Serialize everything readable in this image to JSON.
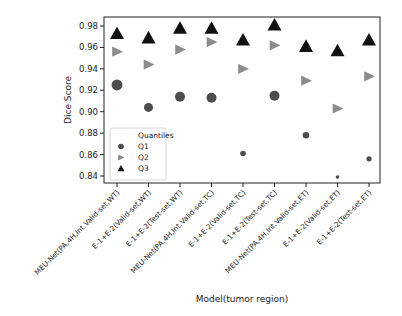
{
  "chart_data": {
    "type": "scatter",
    "title": "",
    "xlabel": "Model(tumor region)",
    "ylabel": "Dice Score",
    "ylim": [
      0.835,
      0.986
    ],
    "yticks": [
      0.84,
      0.86,
      0.88,
      0.9,
      0.92,
      0.94,
      0.96,
      0.98
    ],
    "ytick_labels": [
      "0.84",
      "0.86",
      "0.88",
      "0.90",
      "0.92",
      "0.94",
      "0.96",
      "0.98"
    ],
    "grid": false,
    "legend_position": "lower left",
    "legend_title": "Quantiles",
    "categories": [
      "MEU-Net(PA,4H,Int.Valid-set,WT)",
      "E-1+E-2(Valid-set,WT)",
      "E-1+E-2(Test-set,WT)",
      "MEU-Net(PA,4H,Int.Valid-set,TC)",
      "E-1+E-2(Valid-set,TC)",
      "E-1+E-2(Test-set,TC)",
      "MEU-Net(PA,4H,Int.Valid-set,ET)",
      "E-1+E-2(Valid-set,ET)",
      "E-1+E-2(Test-set,ET)"
    ],
    "series": [
      {
        "name": "Q1",
        "marker": "circle",
        "color": "#4d4d4d",
        "values": [
          0.925,
          0.904,
          0.914,
          0.913,
          0.861,
          0.915,
          0.878,
          0.839,
          0.856
        ]
      },
      {
        "name": "Q2",
        "marker": "triangle-right",
        "color": "#8c8c8c",
        "values": [
          0.956,
          0.944,
          0.958,
          0.965,
          0.94,
          0.962,
          0.929,
          0.903,
          0.933
        ]
      },
      {
        "name": "Q3",
        "marker": "triangle-up",
        "color": "#111111",
        "values": [
          0.973,
          0.969,
          0.978,
          0.978,
          0.967,
          0.981,
          0.961,
          0.957,
          0.967
        ]
      }
    ],
    "q1_marker_sizes": [
      5.5,
      4.5,
      5.0,
      5.0,
      2.8,
      5.0,
      3.3,
      1.8,
      2.6
    ]
  }
}
